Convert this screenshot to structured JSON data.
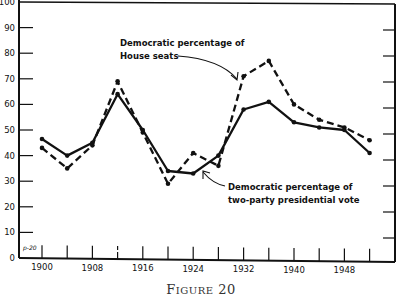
{
  "chart_data": {
    "type": "line",
    "title": "",
    "caption": "Figure 20",
    "xlabel": "",
    "ylabel": "",
    "x": [
      1900,
      1904,
      1908,
      1912,
      1916,
      1920,
      1924,
      1928,
      1932,
      1936,
      1940,
      1944,
      1948,
      1952
    ],
    "x_tick_labels": [
      "1900",
      "1908",
      "1916",
      "1924",
      "1932",
      "1940",
      "1948"
    ],
    "y_tick_labels": [
      "0",
      "10",
      "20",
      "30",
      "40",
      "50",
      "60",
      "70",
      "80",
      "90",
      "100"
    ],
    "ylim": [
      0,
      100
    ],
    "grid": false,
    "series": [
      {
        "name": "Democratic percentage of House seats",
        "style": "dashed",
        "values": [
          43,
          35,
          44,
          69,
          49,
          29,
          41,
          36,
          71,
          77,
          60,
          54,
          51,
          46
        ]
      },
      {
        "name": "Democratic percentage of two-party presidential vote",
        "style": "solid",
        "values": [
          46.5,
          40,
          45,
          64,
          50,
          34,
          33,
          40,
          58,
          61,
          53,
          51,
          50,
          41
        ]
      }
    ],
    "annotations": [
      {
        "lines": [
          "Democratic percentage of",
          "House seats"
        ],
        "target_series": 0
      },
      {
        "lines": [
          "Democratic percentage of",
          "two-party presidential vote"
        ],
        "target_series": 1
      }
    ],
    "corner_mark": "p-20"
  }
}
